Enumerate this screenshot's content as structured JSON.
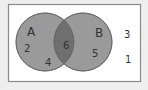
{
  "diagram": {
    "type": "venn",
    "universe": {
      "fill": "#ffffff",
      "stroke": "#8a8a8a"
    },
    "sets": [
      {
        "id": "A",
        "label": "A",
        "fill": "#9a9a9a",
        "stroke": "#6e6e6e"
      },
      {
        "id": "B",
        "label": "B",
        "fill": "#9a9a9a",
        "stroke": "#6e6e6e"
      }
    ],
    "intersection_fill": "#6f6f6f",
    "regions": {
      "A_only": [
        "2",
        "4"
      ],
      "A_and_B": [
        "6"
      ],
      "B_only": [
        "5"
      ],
      "outside": [
        "3",
        "1"
      ]
    },
    "labels": {
      "set_a": "A",
      "set_b": "B",
      "a_only_1": "2",
      "a_only_2": "4",
      "intersection": "6",
      "b_only": "5",
      "outside_1": "3",
      "outside_2": "1"
    }
  }
}
